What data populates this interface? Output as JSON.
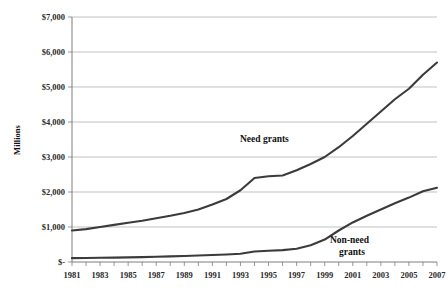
{
  "chart_data": {
    "type": "line",
    "title": "",
    "xlabel": "",
    "ylabel": "Millions",
    "ylim": [
      0,
      7000
    ],
    "xlim": [
      1981,
      2007
    ],
    "grid": true,
    "legend_position": "inline-annotation",
    "y_ticks": [
      0,
      1000,
      2000,
      3000,
      4000,
      5000,
      6000,
      7000
    ],
    "y_tick_labels": [
      "$-",
      "$1,000",
      "$2,000",
      "$3,000",
      "$4,000",
      "$5,000",
      "$6,000",
      "$7,000"
    ],
    "x": [
      1981,
      1982,
      1983,
      1984,
      1985,
      1986,
      1987,
      1988,
      1989,
      1990,
      1991,
      1992,
      1993,
      1994,
      1995,
      1996,
      1997,
      1998,
      1999,
      2000,
      2001,
      2002,
      2003,
      2004,
      2005,
      2006,
      2007
    ],
    "x_tick_labels": [
      "1981",
      "1983",
      "1985",
      "1987",
      "1989",
      "1991",
      "1993",
      "1995",
      "1997",
      "1999",
      "2001",
      "2003",
      "2005",
      "2007"
    ],
    "x_tick_values": [
      1981,
      1983,
      1985,
      1987,
      1989,
      1991,
      1993,
      1995,
      1997,
      1999,
      2001,
      2003,
      2005,
      2007
    ],
    "series": [
      {
        "name": "Need grants",
        "label_x": 1994,
        "label_y": 3250,
        "color": "#3b3b3b",
        "values": [
          900,
          940,
          1000,
          1060,
          1120,
          1180,
          1250,
          1320,
          1400,
          1500,
          1640,
          1800,
          2050,
          2400,
          2450,
          2470,
          2620,
          2800,
          3000,
          3280,
          3600,
          3950,
          4300,
          4650,
          4950,
          5350,
          5700
        ]
      },
      {
        "name": "Non-need grants",
        "label_x": 2001,
        "label_y": 640,
        "color": "#3b3b3b",
        "values": [
          110,
          115,
          120,
          125,
          132,
          140,
          150,
          160,
          172,
          185,
          200,
          215,
          235,
          300,
          320,
          340,
          380,
          480,
          640,
          900,
          1130,
          1320,
          1500,
          1680,
          1840,
          2020,
          2120
        ]
      }
    ]
  },
  "annotations": {
    "need_label": "Need grants",
    "nonneed_label_line1": "Non-need",
    "nonneed_label_line2": "grants"
  }
}
